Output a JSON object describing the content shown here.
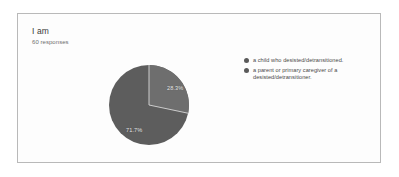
{
  "card": {
    "title": "I am",
    "response_count": "60 responses",
    "background_color": "#fdfdfd",
    "border_color": "#b9b9b9"
  },
  "chart_data": {
    "type": "pie",
    "title": "I am",
    "subtitle": "60 responses",
    "total_responses": 60,
    "categories": [
      "a child who desisted/detransitioned.",
      "a parent or primary caregiver of a desisted/detransitioner."
    ],
    "values": [
      28.3,
      71.7
    ],
    "value_unit": "percent",
    "data_labels": [
      "28.3%",
      "71.7%"
    ],
    "counts": [
      17,
      43
    ],
    "colors": [
      "#6e6e6e",
      "#5d5d5d"
    ],
    "start_angle_deg": 0,
    "direction": "clockwise",
    "legend_position": "right",
    "grid": false,
    "xlabel": "",
    "ylabel": ""
  },
  "legend": {
    "items": [
      {
        "label": "a child who desisted/detransitioned.",
        "color": "#5a5a5a"
      },
      {
        "label": "a parent or primary caregiver of a desisted/detransitioner.",
        "color": "#5a5a5a"
      }
    ]
  }
}
